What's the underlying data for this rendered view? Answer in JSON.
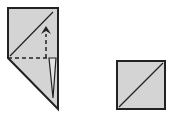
{
  "diagram": {
    "type": "origami-fold-steps",
    "colors": {
      "paper": "#d4d4d4",
      "line": "#222222",
      "background": "#ffffff"
    },
    "steps": [
      {
        "label": "",
        "shape": "folded-polygon-with-valley-fold-arrow"
      },
      {
        "label": "",
        "shape": "square-with-diagonal"
      }
    ]
  }
}
